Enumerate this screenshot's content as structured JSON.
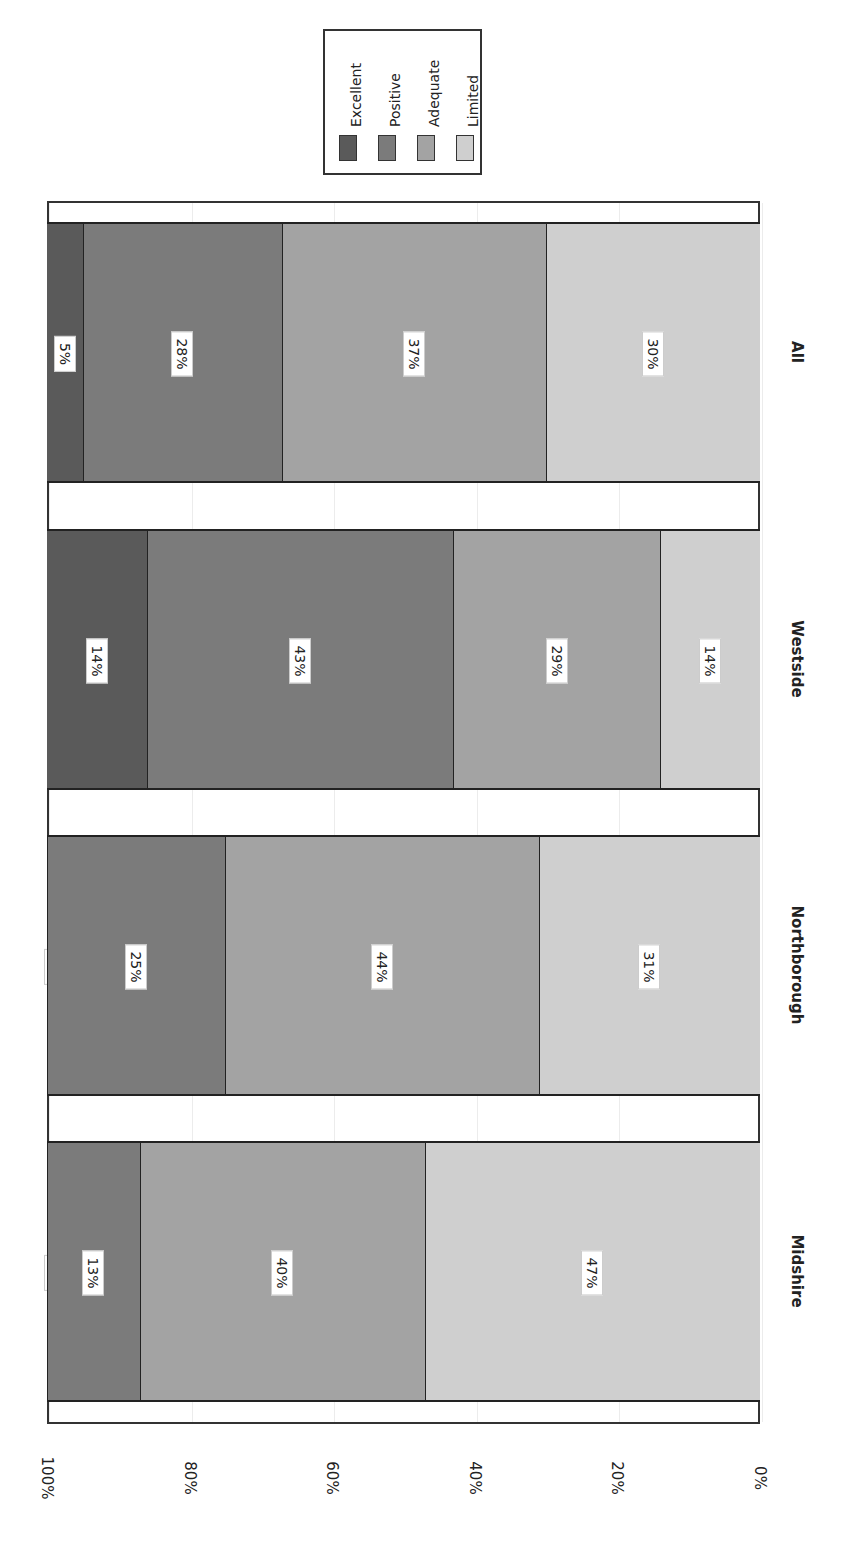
{
  "chart_data": {
    "type": "bar",
    "stacked": true,
    "percent_stacked": true,
    "orientation": "rotated 90° clockwise (vertical stacked bars shown sideways)",
    "title": "",
    "xlabel": "",
    "ylabel": "",
    "ylim": [
      0,
      100
    ],
    "y_ticks": [
      "0%",
      "20%",
      "40%",
      "60%",
      "80%",
      "100%"
    ],
    "categories": [
      "Midshire",
      "Northborough",
      "Westside",
      "All"
    ],
    "series": [
      {
        "name": "Excellent",
        "color": "#5a5a5a",
        "values": [
          0,
          0,
          14,
          5
        ]
      },
      {
        "name": "Positive",
        "color": "#7b7b7b",
        "values": [
          13,
          25,
          43,
          28
        ]
      },
      {
        "name": "Adequate",
        "color": "#a3a3a3",
        "values": [
          40,
          44,
          29,
          37
        ]
      },
      {
        "name": "Limited",
        "color": "#cfcfcf",
        "values": [
          47,
          31,
          14,
          30
        ]
      }
    ],
    "data_labels": {
      "Midshire": {
        "Excellent": "0%",
        "Positive": "13%",
        "Adequate": "40%",
        "Limited": "47%"
      },
      "Northborough": {
        "Excellent": "0%",
        "Positive": "25%",
        "Adequate": "44%",
        "Limited": "31%"
      },
      "Westside": {
        "Excellent": "14%",
        "Positive": "43%",
        "Adequate": "29%",
        "Limited": "14%"
      },
      "All": {
        "Excellent": "5%",
        "Positive": "28%",
        "Adequate": "37%",
        "Limited": "30%"
      }
    },
    "legend": {
      "position": "top",
      "entries": [
        "Excellent",
        "Positive",
        "Adequate",
        "Limited"
      ]
    },
    "grid": true
  },
  "axis": {
    "ticks": [
      {
        "label": "100%",
        "x": 47
      },
      {
        "label": "80%",
        "x": 190
      },
      {
        "label": "60%",
        "x": 332
      },
      {
        "label": "40%",
        "x": 475
      },
      {
        "label": "20%",
        "x": 617
      },
      {
        "label": "0%",
        "x": 760
      }
    ]
  },
  "legend": {
    "items": [
      {
        "label": "Excellent",
        "color": "#5a5a5a"
      },
      {
        "label": "Positive",
        "color": "#7b7b7b"
      },
      {
        "label": "Adequate",
        "color": "#a3a3a3"
      },
      {
        "label": "Limited",
        "color": "#cfcfcf"
      }
    ]
  },
  "bars": [
    {
      "category": "All",
      "top": 222,
      "segments": [
        {
          "name": "Excellent",
          "value": 5,
          "label": "5%"
        },
        {
          "name": "Positive",
          "value": 28,
          "label": "28%"
        },
        {
          "name": "Adequate",
          "value": 37,
          "label": "37%"
        },
        {
          "name": "Limited",
          "value": 30,
          "label": "30%"
        }
      ]
    },
    {
      "category": "Westside",
      "top": 529,
      "segments": [
        {
          "name": "Excellent",
          "value": 14,
          "label": "14%"
        },
        {
          "name": "Positive",
          "value": 43,
          "label": "43%"
        },
        {
          "name": "Adequate",
          "value": 29,
          "label": "29%"
        },
        {
          "name": "Limited",
          "value": 14,
          "label": "14%"
        }
      ]
    },
    {
      "category": "Northborough",
      "top": 835,
      "segments": [
        {
          "name": "Excellent",
          "value": 0,
          "label": "0%"
        },
        {
          "name": "Positive",
          "value": 25,
          "label": "25%"
        },
        {
          "name": "Adequate",
          "value": 44,
          "label": "44%"
        },
        {
          "name": "Limited",
          "value": 31,
          "label": "31%"
        }
      ]
    },
    {
      "category": "Midshire",
      "top": 1141,
      "segments": [
        {
          "name": "Excellent",
          "value": 0,
          "label": "0%"
        },
        {
          "name": "Positive",
          "value": 13,
          "label": "13%"
        },
        {
          "name": "Adequate",
          "value": 40,
          "label": "40%"
        },
        {
          "name": "Limited",
          "value": 47,
          "label": "47%"
        }
      ]
    }
  ]
}
